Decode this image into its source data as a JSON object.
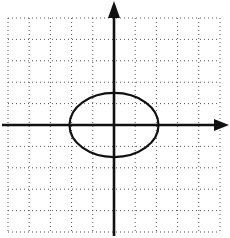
{
  "figure": {
    "type": "coordinate-plane-with-ellipse",
    "grid": {
      "cells_x": 10,
      "cells_y": 10,
      "x_range": [
        -5,
        5
      ],
      "y_range": [
        -5,
        5
      ],
      "style": "dotted",
      "color": "#555555"
    },
    "axes": {
      "color": "#111111",
      "x_arrow": "right",
      "y_arrow": "up"
    },
    "ellipse": {
      "center": [
        0,
        0
      ],
      "semi_axis_x": 2.1,
      "semi_axis_y": 1.5,
      "color": "#111111"
    }
  }
}
